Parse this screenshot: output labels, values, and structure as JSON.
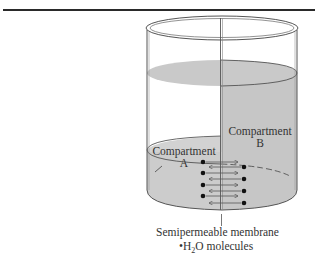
{
  "figure": {
    "compartment_a": {
      "label_line1": "Compartment",
      "label_line2": "A"
    },
    "compartment_b": {
      "label_line1": "Compartment",
      "label_line2": "B"
    },
    "membrane_label": "Semipermeable membrane",
    "legend": {
      "bullet": "•",
      "text_pre": "H",
      "subscript": "2",
      "text_post": "O molecules"
    },
    "colors": {
      "liquid_fill": "#c8c8c8",
      "line": "#333333",
      "background": "#ffffff"
    }
  }
}
